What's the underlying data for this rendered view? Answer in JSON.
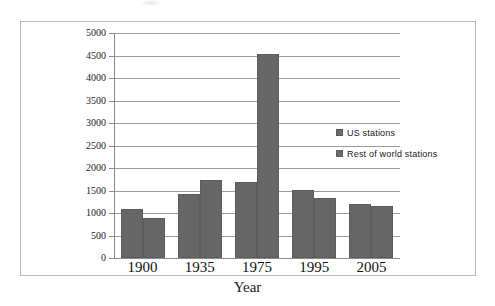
{
  "chart_data": {
    "type": "bar",
    "title": "",
    "xlabel": "Year",
    "ylabel": "",
    "categories": [
      "1900",
      "1935",
      "1975",
      "1995",
      "2005"
    ],
    "series": [
      {
        "name": "US stations",
        "values": [
          1080,
          1430,
          1690,
          1500,
          1200
        ]
      },
      {
        "name": "Rest of world stations",
        "values": [
          890,
          1730,
          4530,
          1340,
          1160
        ]
      }
    ],
    "ylim": [
      0,
      5000
    ],
    "ytick_step": 500,
    "yticks": [
      "5000",
      "4500",
      "4000",
      "3500",
      "3000",
      "2500",
      "2000",
      "1500",
      "1000",
      "500",
      "0"
    ],
    "grid": true,
    "legend_position": "middle-right",
    "bar_color": "#666666",
    "grid_color": "#9a9a9a",
    "axis_color": "#8a8a8a",
    "frame_color": "#b9b9b9",
    "background": "#ffffff"
  },
  "legend": {
    "entries": [
      {
        "label": "US stations"
      },
      {
        "label": "Rest of world stations"
      }
    ]
  },
  "axis": {
    "x_title": "Year"
  }
}
